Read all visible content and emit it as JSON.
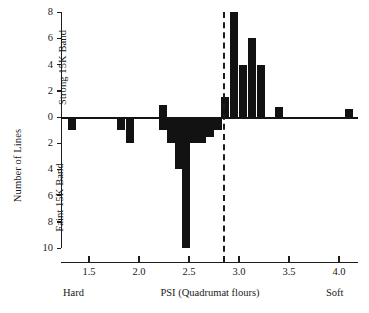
{
  "chart_data": {
    "type": "bar",
    "title": "",
    "subtitle": "",
    "xlabel": "PSI (Quadrumat flours)",
    "ylabel": "Number of Lines",
    "axis_group_labels": {
      "upper": "Strong 15K Band",
      "lower": "Faint 15K Band"
    },
    "x_end_labels": {
      "left": "Hard",
      "right": "Soft"
    },
    "xlim": [
      1.22,
      4.2
    ],
    "ylim": [
      -10,
      8
    ],
    "y_positive_label_note": "values above zero = Strong 15K Band",
    "y_negative_label_note": "values below zero = Faint 15K Band",
    "grid": false,
    "legend": "none",
    "yticks_upper": [
      0,
      2,
      4,
      6,
      8
    ],
    "yticks_lower": [
      2,
      4,
      6,
      8,
      10
    ],
    "ytick_labels": [
      "8",
      "6",
      "4",
      "2",
      "0",
      "2",
      "4",
      "6",
      "8",
      "10"
    ],
    "ytick_values": [
      8,
      6,
      4,
      2,
      0,
      -2,
      -4,
      -6,
      -8,
      -10
    ],
    "xticks": [
      1.5,
      2.0,
      2.5,
      3.0,
      3.5,
      4.0
    ],
    "xtick_labels": [
      "1.5",
      "2.0",
      "2.5",
      "3.0",
      "3.5",
      "4.0"
    ],
    "annotations": [
      {
        "name": "threshold-line",
        "type": "vline",
        "x": 2.85,
        "style": "dashed"
      }
    ],
    "x": [
      1.33,
      1.82,
      1.91,
      2.24,
      2.24,
      2.32,
      2.4,
      2.47,
      2.55,
      2.63,
      2.71,
      2.79,
      2.86,
      2.95,
      3.04,
      3.13,
      3.22,
      3.4,
      4.1
    ],
    "values": [
      -1,
      -1,
      -2,
      0.9,
      -1,
      -2,
      -4,
      -10,
      -2,
      -2,
      -1.5,
      -1,
      1.5,
      8,
      4,
      6,
      4,
      0.8,
      0.6
    ],
    "bars": [
      {
        "x": 1.33,
        "value": -1
      },
      {
        "x": 1.82,
        "value": -1
      },
      {
        "x": 1.91,
        "value": -2
      },
      {
        "x": 2.24,
        "value": 0.9
      },
      {
        "x": 2.24,
        "value": -1
      },
      {
        "x": 2.32,
        "value": -2
      },
      {
        "x": 2.4,
        "value": -4
      },
      {
        "x": 2.47,
        "value": -10
      },
      {
        "x": 2.55,
        "value": -2
      },
      {
        "x": 2.63,
        "value": -2
      },
      {
        "x": 2.71,
        "value": -1.5
      },
      {
        "x": 2.79,
        "value": -1
      },
      {
        "x": 2.86,
        "value": 1.5
      },
      {
        "x": 2.95,
        "value": 8
      },
      {
        "x": 3.04,
        "value": 4
      },
      {
        "x": 3.13,
        "value": 6
      },
      {
        "x": 3.22,
        "value": 4
      },
      {
        "x": 3.4,
        "value": 0.8
      },
      {
        "x": 4.1,
        "value": 0.6
      }
    ],
    "colors": {
      "bar": "#121212",
      "axis": "#1d1d1d",
      "threshold": "#1b1b1b"
    }
  }
}
